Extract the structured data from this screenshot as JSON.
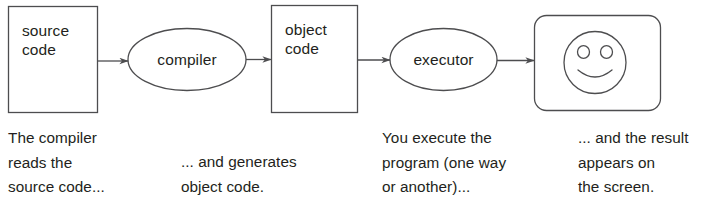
{
  "diagram": {
    "stroke_color": "#4d4d4f",
    "text_color": "#231f20",
    "background": "#ffffff",
    "nodes": [
      {
        "id": "source-code",
        "shape": "rect",
        "label": "source\ncode"
      },
      {
        "id": "compiler",
        "shape": "ellipse",
        "label": "compiler"
      },
      {
        "id": "object-code",
        "shape": "rect",
        "label": "object\ncode"
      },
      {
        "id": "executor",
        "shape": "ellipse",
        "label": "executor"
      },
      {
        "id": "screen",
        "shape": "rounded-rect",
        "label": ""
      }
    ],
    "icons": [
      {
        "id": "smiley-face-icon",
        "inside": "screen"
      }
    ],
    "arrows": [
      {
        "id": "arrow-source-to-compiler",
        "from": "source-code",
        "to": "compiler"
      },
      {
        "id": "arrow-compiler-to-object",
        "from": "compiler",
        "to": "object-code"
      },
      {
        "id": "arrow-object-to-executor",
        "from": "object-code",
        "to": "executor"
      },
      {
        "id": "arrow-executor-to-screen",
        "from": "executor",
        "to": "screen"
      }
    ]
  },
  "captions": [
    {
      "id": "caption-compiler-reads",
      "text": "The compiler\nreads the\nsource code..."
    },
    {
      "id": "caption-generates-object",
      "text": "... and generates\nobject code."
    },
    {
      "id": "caption-you-execute",
      "text": "You execute the\nprogram (one way\nor another)..."
    },
    {
      "id": "caption-result-screen",
      "text": "... and the result\nappears on\nthe screen."
    }
  ]
}
